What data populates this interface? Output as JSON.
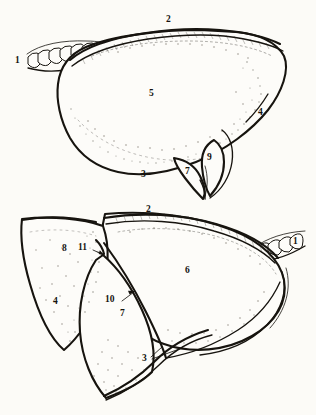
{
  "plate": {
    "type": "anatomical-line-drawing",
    "subject": "lung lobes, two views",
    "background_color": "#fcfbf7",
    "ink_color": "#17140f",
    "figures": [
      {
        "id": "upper-figure",
        "name": "lateral-view",
        "description": "Lung seen from lateral aspect with bronchus entering at upper left and a tongue-like lingula/tail at lower right",
        "labels": [
          {
            "key": "1",
            "text": "1",
            "x": 18,
            "y": 62,
            "target": "bronchus-rings"
          },
          {
            "key": "2",
            "text": "2",
            "x": 168,
            "y": 21,
            "target": "superior-border"
          },
          {
            "key": "3",
            "text": "3",
            "x": 144,
            "y": 176,
            "target": "inferior-border"
          },
          {
            "key": "4",
            "text": "4",
            "x": 261,
            "y": 114,
            "target": "posterior-border"
          },
          {
            "key": "5",
            "text": "5",
            "x": 152,
            "y": 95,
            "target": "costal-surface"
          },
          {
            "key": "7",
            "text": "7",
            "x": 188,
            "y": 173,
            "target": "lower-tongue"
          },
          {
            "key": "9",
            "text": "9",
            "x": 210,
            "y": 159,
            "target": "notch-recess"
          }
        ]
      },
      {
        "id": "lower-figure",
        "name": "medial-oblique-view",
        "description": "Lung seen with lobes separated, bronchus entering at right, three lobe faces visible",
        "labels": [
          {
            "key": "1",
            "text": "1",
            "x": 296,
            "y": 243,
            "target": "bronchus-rings"
          },
          {
            "key": "2",
            "text": "2",
            "x": 149,
            "y": 211,
            "target": "superior-border"
          },
          {
            "key": "3",
            "text": "3",
            "x": 145,
            "y": 360,
            "target": "inferior-border"
          },
          {
            "key": "4",
            "text": "4",
            "x": 56,
            "y": 303,
            "target": "lobe-edge"
          },
          {
            "key": "6",
            "text": "6",
            "x": 188,
            "y": 272,
            "target": "large-lobe-face"
          },
          {
            "key": "7",
            "text": "7",
            "x": 123,
            "y": 315,
            "target": "middle-lobe-face"
          },
          {
            "key": "8",
            "text": "8",
            "x": 65,
            "y": 250,
            "target": "left-lobe-face"
          },
          {
            "key": "10",
            "text": "10",
            "x": 111,
            "y": 301,
            "target": "fissure-line"
          },
          {
            "key": "11",
            "text": "11",
            "x": 83,
            "y": 249,
            "target": "apex-notch"
          }
        ]
      }
    ]
  }
}
